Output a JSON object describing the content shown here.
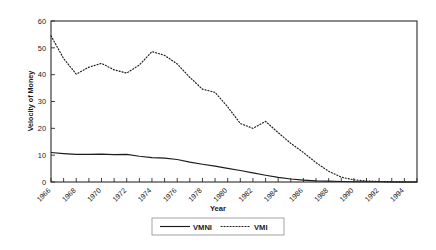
{
  "chart_data": {
    "type": "line",
    "title": "",
    "xlabel": "Year",
    "ylabel": "Velocity of Money",
    "xlim": [
      1966,
      1995
    ],
    "ylim": [
      0,
      60
    ],
    "yticks": [
      0,
      10,
      20,
      30,
      40,
      50,
      60
    ],
    "xticks": [
      1966,
      1968,
      1970,
      1972,
      1974,
      1976,
      1978,
      1980,
      1982,
      1984,
      1986,
      1988,
      1990,
      1992,
      1994
    ],
    "xtick_labels": [
      "1966",
      "1968",
      "1970",
      "1972",
      "1974",
      "1976",
      "1978",
      "1980",
      "1982",
      "1984",
      "1986",
      "1988",
      "1990",
      "1992",
      "1994"
    ],
    "ytick_labels": [
      "0",
      "10",
      "20",
      "30",
      "40",
      "50",
      "60"
    ],
    "grid": false,
    "legend_position": "bottom",
    "x": [
      1966,
      1967,
      1968,
      1969,
      1970,
      1971,
      1972,
      1973,
      1974,
      1975,
      1976,
      1977,
      1978,
      1979,
      1980,
      1981,
      1982,
      1983,
      1984,
      1985,
      1986,
      1987,
      1988,
      1989,
      1990,
      1991,
      1992,
      1993,
      1994,
      1995
    ],
    "series": [
      {
        "name": "VMNI",
        "style": "solid",
        "color": "#1c1c1c",
        "values": [
          11.0,
          10.6,
          10.3,
          10.3,
          10.4,
          10.2,
          10.3,
          9.6,
          9.1,
          8.9,
          8.4,
          7.4,
          6.6,
          5.9,
          5.1,
          4.3,
          3.4,
          2.5,
          1.7,
          1.1,
          0.7,
          0.4,
          0.3,
          0.2,
          0.1,
          0.1,
          0.1,
          0.0,
          0.0,
          0.0
        ]
      },
      {
        "name": "VMI",
        "style": "dotted",
        "color": "#1c1c1c",
        "values": [
          54.5,
          46.0,
          40.2,
          42.8,
          44.2,
          41.8,
          40.6,
          43.6,
          48.6,
          47.2,
          44.0,
          39.0,
          34.6,
          33.4,
          28.0,
          21.8,
          20.0,
          22.6,
          18.4,
          14.4,
          11.0,
          7.2,
          4.0,
          1.8,
          0.8,
          0.4,
          0.2,
          0.1,
          0.0,
          0.0
        ]
      }
    ],
    "legend": [
      {
        "label": "VMNI",
        "style": "solid"
      },
      {
        "label": "VMI",
        "style": "dotted"
      }
    ]
  }
}
